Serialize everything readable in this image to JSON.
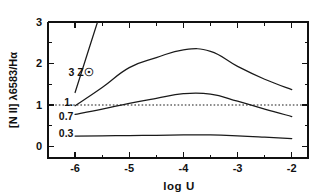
{
  "chart_data": {
    "type": "line",
    "title": "",
    "xlabel": "log U",
    "ylabel": "[N II] λ6583/Hα",
    "xlim": [
      -6.5,
      -1.7
    ],
    "ylim": [
      -0.28,
      3.0
    ],
    "xticks": [
      -6,
      -5,
      -4,
      -3,
      -2
    ],
    "xticklabels": [
      "-6",
      "-5",
      "-4",
      "-3",
      "-2"
    ],
    "xminorticks": [
      -5.5,
      -4.5,
      -3.5,
      -2.5
    ],
    "yticks": [
      0,
      1,
      2,
      3
    ],
    "yticklabels": [
      "0",
      "1",
      "2",
      "3"
    ],
    "yminorticks": [
      0.5,
      1.5,
      2.5
    ],
    "grid": false,
    "legend": "inline-curve-labels",
    "annotations": [
      {
        "text": "3 Z☉",
        "x": -6.12,
        "y": 1.78,
        "name": "curve-label-3zsun"
      },
      {
        "text": "1.",
        "x": -6.2,
        "y": 1.06,
        "name": "curve-label-1"
      },
      {
        "text": "0.7",
        "x": -6.3,
        "y": 0.72,
        "name": "curve-label-07"
      },
      {
        "text": "0.3",
        "x": -6.3,
        "y": 0.3,
        "name": "curve-label-03"
      }
    ],
    "reference_lines": [
      {
        "name": "unity-reference-line",
        "orientation": "horizontal",
        "y": 1.0,
        "style": "dotted"
      }
    ],
    "series": [
      {
        "name": "3 Zsun",
        "label": "3 Z☉",
        "x": [
          -6.0,
          -5.72,
          -5.5
        ],
        "values": [
          1.3,
          2.45,
          3.35
        ]
      },
      {
        "name": "1 Zsun",
        "label": "1.",
        "x": [
          -6.0,
          -5.5,
          -5.0,
          -4.5,
          -4.0,
          -3.5,
          -3.0,
          -2.5,
          -2.0
        ],
        "values": [
          0.98,
          1.42,
          1.9,
          2.14,
          2.33,
          2.29,
          1.93,
          1.62,
          1.37
        ]
      },
      {
        "name": "0.7 Zsun",
        "label": "0.7",
        "x": [
          -6.0,
          -5.5,
          -5.0,
          -4.5,
          -4.0,
          -3.5,
          -3.0,
          -2.5,
          -2.0
        ],
        "values": [
          0.77,
          0.9,
          1.04,
          1.16,
          1.27,
          1.26,
          1.09,
          0.9,
          0.72
        ]
      },
      {
        "name": "0.3 Zsun",
        "label": "0.3",
        "x": [
          -6.0,
          -5.5,
          -5.0,
          -4.5,
          -4.0,
          -3.5,
          -3.0,
          -2.5,
          -2.0
        ],
        "values": [
          0.25,
          0.255,
          0.26,
          0.268,
          0.275,
          0.275,
          0.255,
          0.225,
          0.19
        ]
      }
    ]
  }
}
